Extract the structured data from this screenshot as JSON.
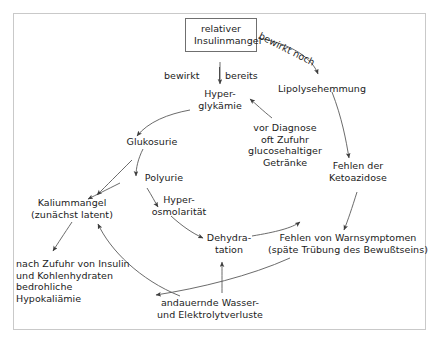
{
  "diagram": {
    "language": "de",
    "frame": {
      "stroke": "#c9c9c9"
    },
    "text_color": "#1b1b1b",
    "arrow_color": "#4a4a4a",
    "box_stroke": "#6f6f6f",
    "nodes": [
      {
        "id": "insulinmangel",
        "label": "relativer\nInsulinmangel",
        "boxed": true
      },
      {
        "id": "hyperglykaemie",
        "label": "Hyper-\nglykämie",
        "boxed": false
      },
      {
        "id": "lipolysehemmung",
        "label": "Lipolysehemmung",
        "boxed": false
      },
      {
        "id": "glukosurie",
        "label": "Glukosurie",
        "boxed": false
      },
      {
        "id": "polyurie",
        "label": "Polyurie",
        "boxed": false
      },
      {
        "id": "hyperosmolaritaet",
        "label": "Hyper-\nosmolarität",
        "boxed": false
      },
      {
        "id": "dehydratation",
        "label": "Dehydra-\ntation",
        "boxed": false
      },
      {
        "id": "kaliummangel",
        "label": "Kaliummangel\n(zunächst latent)",
        "boxed": false
      },
      {
        "id": "getraenke",
        "label": "vor Diagnose\noft Zufuhr\nglucosehaltiger\nGetränke",
        "boxed": false
      },
      {
        "id": "ketoazidose",
        "label": "Fehlen der\nKetoazidose",
        "boxed": false
      },
      {
        "id": "warnsymptome",
        "label": "Fehlen von Warnsymptomen\n(späte Trübung des Bewußtseins)",
        "boxed": false
      },
      {
        "id": "hypokaliaemie",
        "label": "nach Zufuhr von Insulin\nund Kohlenhydraten\nbedrohliche Hypokaliämie",
        "boxed": false
      },
      {
        "id": "verluste",
        "label": "andauernde Wasser-\nund Elektrolytverluste",
        "boxed": false
      }
    ],
    "edge_labels": [
      {
        "id": "bewirkt",
        "text": "bewirkt"
      },
      {
        "id": "bereits",
        "text": "bereits"
      },
      {
        "id": "bewirkt-noch",
        "text": "bewirkt noch"
      }
    ]
  }
}
